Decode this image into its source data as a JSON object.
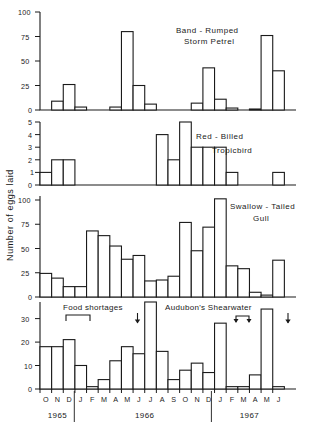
{
  "figure": {
    "ylabel": "Number of eggs laid",
    "months": [
      "O",
      "N",
      "D",
      "J",
      "F",
      "M",
      "A",
      "M",
      "J",
      "J",
      "A",
      "S",
      "O",
      "N",
      "D",
      "J",
      "F",
      "M",
      "A",
      "M",
      "J"
    ],
    "years": [
      {
        "label": "1965",
        "start_index": 0,
        "end_index": 2
      },
      {
        "label": "1966",
        "start_index": 3,
        "end_index": 14
      },
      {
        "label": "1967",
        "start_index": 15,
        "end_index": 20
      }
    ],
    "annotations": {
      "food_shortages_label": "Food shortages",
      "audubon_label": "Audubon's Shearwater"
    }
  },
  "chart_data": [
    {
      "type": "bar",
      "title": "Band-Rumped\nStorm Petrel",
      "title_line1": "Band - Rumped",
      "title_line2": "Storm Petrel",
      "xlabel": "",
      "ylabel": "Number of eggs laid",
      "ylim": [
        0,
        100
      ],
      "yticks": [
        0,
        25,
        50,
        75,
        100
      ],
      "ytick_labels": [
        "0",
        "25",
        "50",
        "75",
        "100"
      ],
      "grid": false,
      "categories": [
        "O 1965",
        "N 1965",
        "D 1965",
        "J 1966",
        "F 1966",
        "M 1966",
        "A 1966",
        "M 1966",
        "J 1966",
        "J 1966",
        "A 1966",
        "S 1966",
        "O 1966",
        "N 1966",
        "D 1966",
        "J 1967",
        "F 1967",
        "M 1967",
        "A 1967",
        "M 1967",
        "J 1967"
      ],
      "values": [
        0,
        9,
        26,
        3,
        0,
        0,
        3,
        80,
        25,
        6,
        0,
        0,
        0,
        7,
        43,
        11,
        2,
        0,
        1,
        76,
        40
      ]
    },
    {
      "type": "bar",
      "title": "Red-Billed\nTropicbird",
      "title_line1": "Red - Billed",
      "title_line2": "Tropicbird",
      "xlabel": "",
      "ylabel": "Number of eggs laid",
      "ylim": [
        0,
        5
      ],
      "yticks": [
        0,
        1,
        2,
        3,
        4,
        5
      ],
      "ytick_labels": [
        "0",
        "1",
        "2",
        "3",
        "4",
        "5"
      ],
      "grid": false,
      "categories": [
        "O 1965",
        "N 1965",
        "D 1965",
        "J 1966",
        "F 1966",
        "M 1966",
        "A 1966",
        "M 1966",
        "J 1966",
        "J 1966",
        "A 1966",
        "S 1966",
        "O 1966",
        "N 1966",
        "D 1966",
        "J 1967",
        "F 1967",
        "M 1967",
        "A 1967",
        "M 1967",
        "J 1967"
      ],
      "values": [
        1,
        2,
        2,
        0,
        0,
        0,
        0,
        0,
        0,
        0,
        4,
        2,
        5,
        3,
        3,
        3,
        1,
        0,
        0,
        0,
        1
      ]
    },
    {
      "type": "bar",
      "title": "Swallow-Tailed\nGull",
      "title_line1": "Swallow - Tailed",
      "title_line2": "Gull",
      "xlabel": "",
      "ylabel": "Number of eggs laid",
      "ylim": [
        0,
        100
      ],
      "yticks": [
        0,
        25,
        50,
        75,
        100
      ],
      "ytick_labels": [
        "0",
        "25",
        "50",
        "75",
        "100"
      ],
      "grid": false,
      "categories": [
        "O 1965",
        "N 1965",
        "D 1965",
        "J 1966",
        "F 1966",
        "M 1966",
        "A 1966",
        "M 1966",
        "J 1966",
        "J 1966",
        "A 1966",
        "S 1966",
        "O 1966",
        "N 1966",
        "D 1966",
        "J 1967",
        "F 1967",
        "M 1967",
        "A 1967",
        "M 1967",
        "J 1967"
      ],
      "values": [
        25,
        20,
        11,
        11,
        70,
        65,
        54,
        40,
        44,
        17,
        18,
        22,
        79,
        49,
        74,
        104,
        33,
        30,
        5,
        2,
        39
      ]
    },
    {
      "type": "bar",
      "title": "Audubon's Shearwater",
      "title_line1": "Audubon's  Shearwater",
      "title_line2": "",
      "xlabel": "",
      "ylabel": "Number of eggs laid",
      "ylim": [
        0,
        37
      ],
      "yticks": [
        0,
        10,
        20,
        30
      ],
      "ytick_labels": [
        "0",
        "10",
        "20",
        "30"
      ],
      "grid": false,
      "categories": [
        "O 1965",
        "N 1965",
        "D 1965",
        "J 1966",
        "F 1966",
        "M 1966",
        "A 1966",
        "M 1966",
        "J 1966",
        "J 1966",
        "A 1966",
        "S 1966",
        "O 1966",
        "N 1966",
        "D 1966",
        "J 1967",
        "F 1967",
        "M 1967",
        "A 1967",
        "M 1967",
        "J 1967"
      ],
      "values": [
        18,
        18,
        21,
        10,
        1,
        4,
        12,
        18,
        15,
        37,
        16,
        4,
        8,
        11,
        7,
        28,
        1,
        1,
        6,
        34,
        1
      ],
      "annotations": [
        {
          "text": "Food shortages",
          "type": "label",
          "x_index_start": 2,
          "x_index_end": 4
        },
        {
          "text": "",
          "type": "bracket",
          "x_index_start": 2,
          "x_index_end": 4
        },
        {
          "text": "",
          "type": "arrow-down",
          "x_index": 8
        },
        {
          "text": "",
          "type": "bracket-arrows",
          "x_index_start": 17,
          "x_index_end": 18
        },
        {
          "text": "",
          "type": "arrow-down",
          "x_index": 21
        }
      ]
    }
  ]
}
